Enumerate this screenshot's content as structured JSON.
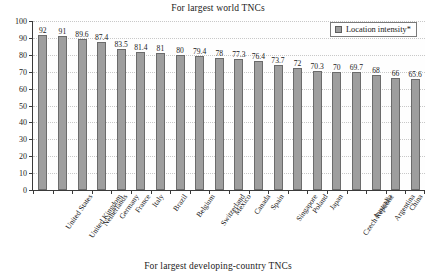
{
  "chart_data": {
    "type": "bar",
    "title": "For largest world TNCs",
    "subtitle": "For largest developing-country TNCs",
    "xlabel": "",
    "ylabel": "",
    "ylim": [
      0,
      100
    ],
    "ytick_step": 10,
    "yticks": [
      100,
      90,
      80,
      70,
      60,
      50,
      40,
      30,
      20,
      10,
      0
    ],
    "grid": true,
    "legend_position": "top-right",
    "legend": [
      "Location intensity*"
    ],
    "bar_color": "#9e9e9e",
    "bar_edge_color": "#6b6b6b",
    "categories": [
      "United States",
      "United Kingdom",
      "Netherlands",
      "Germany",
      "France",
      "Italy",
      "Brazil",
      "Belgium",
      "Switzerland",
      "Mexico",
      "Canada",
      "Spain",
      "Singapore",
      "Poland",
      "Japan",
      "Czech Republic",
      "Australia",
      "Argentina",
      "China",
      "Hong Kong (China)"
    ],
    "values": [
      92,
      91,
      89.6,
      87.4,
      83.5,
      81.4,
      81,
      80,
      79.4,
      78,
      77.3,
      76.4,
      73.7,
      72,
      70.3,
      70,
      69.7,
      68,
      66,
      65.6
    ],
    "value_labels": [
      "92",
      "91",
      "89.6",
      "87.4",
      "83.5",
      "81.4",
      "81",
      "80",
      "79.4",
      "78",
      "77.3",
      "76.4",
      "73.7",
      "72",
      "70.3",
      "70",
      "69.7",
      "68",
      "66",
      "65.6"
    ],
    "series": [
      {
        "name": "Location intensity*",
        "values": [
          92,
          91,
          89.6,
          87.4,
          83.5,
          81.4,
          81,
          80,
          79.4,
          78,
          77.3,
          76.4,
          73.7,
          72,
          70.3,
          70,
          69.7,
          68,
          66,
          65.6
        ]
      }
    ]
  }
}
